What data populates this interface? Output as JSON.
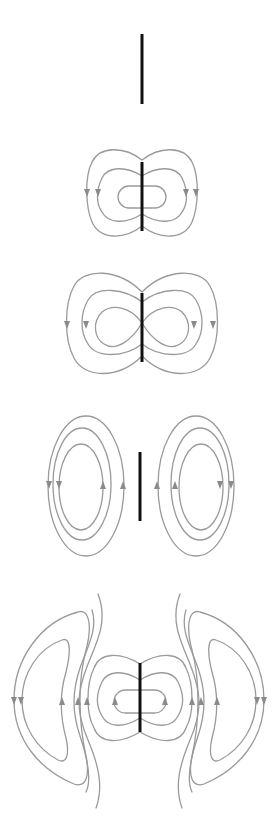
{
  "diagram": {
    "title": "Electric field lines radiating from an oscillating dipole antenna",
    "colors": {
      "background": "#ffffff",
      "antenna": "#111111",
      "field_line": "#9a9a9a",
      "arrow": "#8a8a8a"
    },
    "panels": [
      {
        "id": "stage-1",
        "description": "Antenna alone, no field lines yet"
      },
      {
        "id": "stage-2",
        "description": "Closed field loops forming around antenna, two nested loops plus inner pill"
      },
      {
        "id": "stage-3",
        "description": "Loops pinch inward toward antenna, figure-eight shape"
      },
      {
        "id": "stage-4",
        "description": "Loops detached from antenna as two separate oval sets"
      },
      {
        "id": "stage-5",
        "description": "Detached kidney-shaped loops propagate outward while new loops form at antenna"
      }
    ]
  }
}
